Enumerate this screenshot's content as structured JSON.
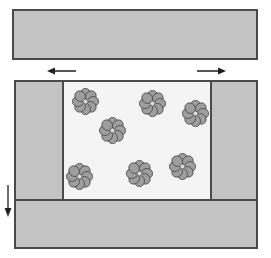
{
  "diagram": {
    "kind": "layer-shear schematic with rosette particles",
    "colors": {
      "background": "#ffffff",
      "band_fill": "#c3c3c3",
      "outline": "#4a4a4a",
      "face_fill": "#f4f4f4",
      "rosette_fill": "#9e9e9e",
      "rosette_outline": "#4f4f4f",
      "rosette_center_fill": "#dadada",
      "arrow_color": "#1f1f1f"
    },
    "top_band": {
      "x": 12,
      "y": 9,
      "width": 246,
      "height": 51
    },
    "main_block": {
      "x": 14,
      "y": 80,
      "width": 244,
      "height": 169
    },
    "face_panel": {
      "x": 62,
      "y": 82,
      "width": 150,
      "height": 117
    },
    "arrows": [
      {
        "name": "left-shear-arrow",
        "direction": "left"
      },
      {
        "name": "right-shear-arrow",
        "direction": "right"
      },
      {
        "name": "down-arrow",
        "direction": "down"
      }
    ],
    "rosettes": {
      "count": 7,
      "petals_per_rosette": 8,
      "diameter": 27,
      "centers": [
        {
          "x": 21,
          "y": 19
        },
        {
          "x": 88,
          "y": 21
        },
        {
          "x": 131,
          "y": 31
        },
        {
          "x": 48,
          "y": 48
        },
        {
          "x": 15,
          "y": 94
        },
        {
          "x": 75,
          "y": 91
        },
        {
          "x": 118,
          "y": 84
        }
      ]
    }
  }
}
